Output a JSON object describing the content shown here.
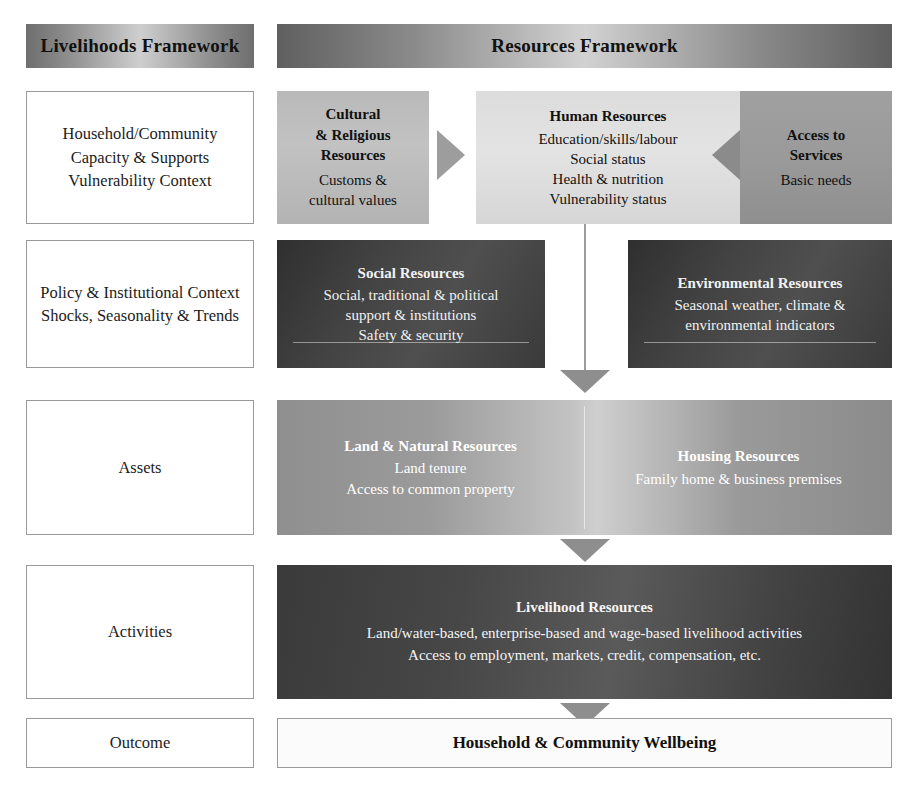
{
  "headers": {
    "left": "Livelihoods Framework",
    "right": "Resources Framework"
  },
  "left_column": [
    {
      "id": "capacity",
      "text": "Household/Community\nCapacity & Supports\nVulnerability Context"
    },
    {
      "id": "policy",
      "text": "Policy & Institutional Context\nShocks, Seasonality & Trends"
    },
    {
      "id": "assets",
      "text": "Assets"
    },
    {
      "id": "activities",
      "text": "Activities"
    },
    {
      "id": "outcome",
      "text": "Outcome"
    }
  ],
  "row1": {
    "cultural": {
      "title": "Cultural\n& Religious\nResources",
      "sub": "Customs &\ncultural values"
    },
    "human": {
      "title": "Human Resources",
      "sub": "Education/skills/labour\nSocial status\nHealth & nutrition\nVulnerability status"
    },
    "access": {
      "title": "Access to\nServices",
      "sub": "Basic needs"
    }
  },
  "row2": {
    "social": {
      "title": "Social Resources",
      "sub": "Social, traditional & political\nsupport & institutions\nSafety & security"
    },
    "environmental": {
      "title": "Environmental Resources",
      "sub": "Seasonal weather, climate &\nenvironmental indicators"
    }
  },
  "row3": {
    "land": {
      "title": "Land & Natural Resources",
      "sub": "Land tenure\nAccess to common property"
    },
    "housing": {
      "title": "Housing Resources",
      "sub": "Family home & business premises"
    }
  },
  "row4": {
    "livelihood": {
      "title": "Livelihood Resources",
      "sub": "Land/water-based, enterprise-based and wage-based livelihood activities\nAccess to employment, markets, credit, compensation, etc."
    }
  },
  "row5": {
    "outcome": {
      "title": "Household & Community Wellbeing"
    }
  },
  "arrows": {
    "cultural_to_human": "arrow-right-icon",
    "access_to_human": "arrow-left-icon",
    "human_to_assets": "arrow-down-icon",
    "assets_to_activities": "arrow-down-icon",
    "activities_to_outcome": "arrow-down-icon"
  },
  "colors": {
    "header_mid": "#d2d2d2",
    "header_edge": "#5f5f5f",
    "light_grey": "#bdbdbd",
    "mid_grey": "#9a9a9a",
    "pale": "#dcdcdc",
    "dark": "#3f3f3f",
    "arrow": "#9a9a9a",
    "border": "#9a9a9a"
  }
}
